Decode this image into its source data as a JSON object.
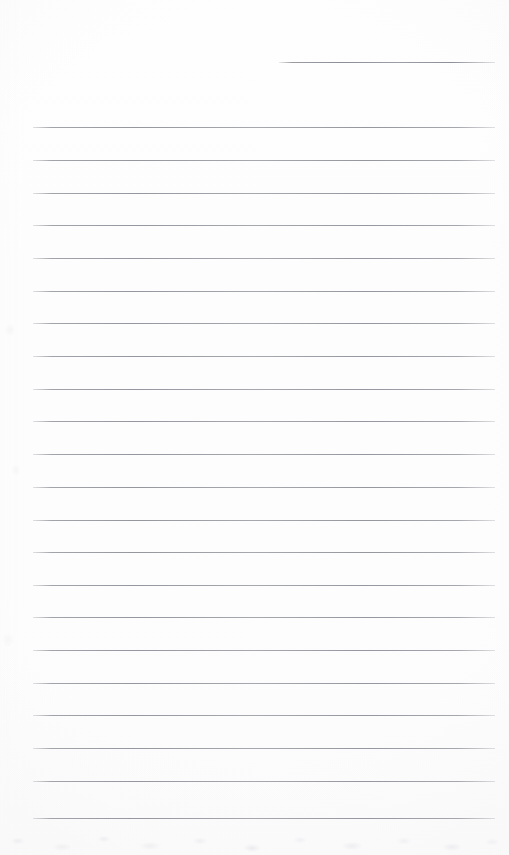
{
  "document": {
    "type": "scanned-lined-paper",
    "title": "Lined Notepad Page",
    "page_width": 509,
    "page_height": 855,
    "background_color": "#fdfdfd",
    "rule_color": "#96969e",
    "rule_thickness": 1,
    "rule_spacing": 32.7,
    "content_text": "",
    "has_handwriting": false,
    "notes": "Blank ruled sheet; no text, headings, or marks present."
  },
  "rules": [
    {
      "id": "rule-0",
      "y": 62,
      "x_start": 279,
      "x_end": 495,
      "short": true,
      "label": "partial-rule-top-right"
    },
    {
      "id": "rule-1",
      "y": 127,
      "x_start": 33,
      "x_end": 495,
      "short": false,
      "label": "rule"
    },
    {
      "id": "rule-2",
      "y": 160,
      "x_start": 33,
      "x_end": 495,
      "short": false,
      "label": "rule"
    },
    {
      "id": "rule-3",
      "y": 193,
      "x_start": 33,
      "x_end": 495,
      "short": false,
      "label": "rule"
    },
    {
      "id": "rule-4",
      "y": 225,
      "x_start": 33,
      "x_end": 495,
      "short": false,
      "label": "rule"
    },
    {
      "id": "rule-5",
      "y": 258,
      "x_start": 33,
      "x_end": 495,
      "short": false,
      "label": "rule"
    },
    {
      "id": "rule-6",
      "y": 291,
      "x_start": 33,
      "x_end": 495,
      "short": false,
      "label": "rule"
    },
    {
      "id": "rule-7",
      "y": 323,
      "x_start": 33,
      "x_end": 495,
      "short": false,
      "label": "rule"
    },
    {
      "id": "rule-8",
      "y": 356,
      "x_start": 33,
      "x_end": 495,
      "short": false,
      "label": "rule"
    },
    {
      "id": "rule-9",
      "y": 389,
      "x_start": 33,
      "x_end": 495,
      "short": false,
      "label": "rule"
    },
    {
      "id": "rule-10",
      "y": 421,
      "x_start": 33,
      "x_end": 495,
      "short": false,
      "label": "rule"
    },
    {
      "id": "rule-11",
      "y": 454,
      "x_start": 33,
      "x_end": 495,
      "short": false,
      "label": "rule"
    },
    {
      "id": "rule-12",
      "y": 487,
      "x_start": 33,
      "x_end": 495,
      "short": false,
      "label": "rule"
    },
    {
      "id": "rule-13",
      "y": 520,
      "x_start": 33,
      "x_end": 495,
      "short": false,
      "label": "rule"
    },
    {
      "id": "rule-14",
      "y": 552,
      "x_start": 33,
      "x_end": 495,
      "short": false,
      "label": "rule"
    },
    {
      "id": "rule-15",
      "y": 585,
      "x_start": 33,
      "x_end": 495,
      "short": false,
      "label": "rule"
    },
    {
      "id": "rule-16",
      "y": 617,
      "x_start": 33,
      "x_end": 495,
      "short": false,
      "label": "rule"
    },
    {
      "id": "rule-17",
      "y": 650,
      "x_start": 33,
      "x_end": 495,
      "short": false,
      "label": "rule"
    },
    {
      "id": "rule-18",
      "y": 683,
      "x_start": 33,
      "x_end": 495,
      "short": false,
      "label": "rule"
    },
    {
      "id": "rule-19",
      "y": 715,
      "x_start": 33,
      "x_end": 495,
      "short": false,
      "label": "rule"
    },
    {
      "id": "rule-20",
      "y": 748,
      "x_start": 33,
      "x_end": 495,
      "short": false,
      "label": "rule"
    },
    {
      "id": "rule-21",
      "y": 781,
      "x_start": 33,
      "x_end": 495,
      "short": false,
      "label": "rule"
    },
    {
      "id": "rule-22",
      "y": 818,
      "x_start": 33,
      "x_end": 495,
      "short": false,
      "label": "rule"
    }
  ]
}
